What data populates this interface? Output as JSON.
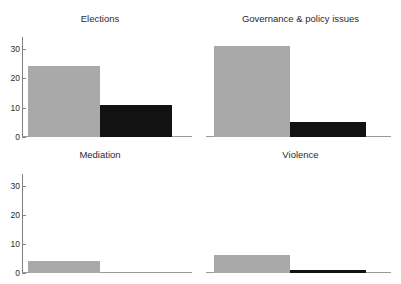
{
  "figure": {
    "clipped_top_text": "",
    "bar_colors": {
      "series_1": "#a9a9a9",
      "series_2": "#121212"
    },
    "axis_color": "#808080",
    "text_color": "#2b2b2b"
  },
  "panels": [
    {
      "title": "Elections"
    },
    {
      "title": "Governance & policy issues"
    },
    {
      "title": "Mediation"
    },
    {
      "title": "Violence"
    }
  ],
  "yaxis": {
    "tick_labels": [
      "0",
      "10",
      "20",
      "30"
    ],
    "tick_values": [
      0,
      10,
      20,
      30
    ],
    "min": 0,
    "max": 34
  },
  "chart_data": {
    "type": "bar",
    "title": "",
    "xlabel": "",
    "ylabel": "",
    "ylim": [
      0,
      34
    ],
    "yticks": [
      0,
      10,
      20,
      30
    ],
    "grid": false,
    "legend": null,
    "layout": {
      "facet_rows": 2,
      "facet_cols": 2,
      "shared_y_axis": true
    },
    "facets": [
      {
        "title": "Elections",
        "categories": [
          "series 1",
          "series 2"
        ],
        "values": [
          24,
          11
        ],
        "colors": [
          "#a9a9a9",
          "#121212"
        ]
      },
      {
        "title": "Governance & policy issues",
        "categories": [
          "series 1",
          "series 2"
        ],
        "values": [
          31,
          5
        ],
        "colors": [
          "#a9a9a9",
          "#121212"
        ]
      },
      {
        "title": "Mediation",
        "categories": [
          "series 1",
          "series 2"
        ],
        "values": [
          4,
          0
        ],
        "colors": [
          "#a9a9a9",
          "#121212"
        ]
      },
      {
        "title": "Violence",
        "categories": [
          "series 1",
          "series 2"
        ],
        "values": [
          6,
          1
        ],
        "colors": [
          "#a9a9a9",
          "#121212"
        ]
      }
    ]
  }
}
